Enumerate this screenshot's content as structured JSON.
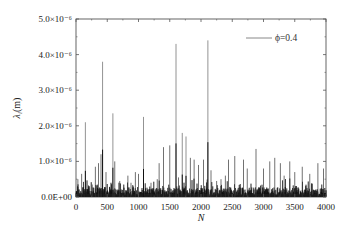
{
  "chart_data": {
    "type": "line",
    "title": "",
    "xlabel": "N",
    "ylabel": "λ_i(m)",
    "xlim": [
      0,
      4000
    ],
    "ylim": [
      0,
      5e-06
    ],
    "x_ticks": [
      0,
      500,
      1000,
      1500,
      2000,
      2500,
      3000,
      3500,
      4000
    ],
    "x_tick_labels": [
      "0",
      "500",
      "1000",
      "1500",
      "2000",
      "2500",
      "3000",
      "3500",
      "4000"
    ],
    "y_ticks": [
      0,
      1e-06,
      2e-06,
      3e-06,
      4e-06,
      5e-06
    ],
    "y_tick_labels": [
      "0.0E+00",
      "1.0×10⁻⁶",
      "2.0×10⁻⁶",
      "3.0×10⁻⁶",
      "4.0×10⁻⁶",
      "5.0×10⁻⁶"
    ],
    "grid": false,
    "legend_position": "upper right",
    "baseline_level": 1.5e-07,
    "series": [
      {
        "name": "ϕ=0.4",
        "color": "#000000",
        "description": "Noisy signal of 4000 points, dense baseline ~0–5e-7 with sparse tall spikes",
        "spikes": [
          {
            "x": 30,
            "y": 5e-07
          },
          {
            "x": 90,
            "y": 6.5e-07
          },
          {
            "x": 150,
            "y": 2.1e-06
          },
          {
            "x": 260,
            "y": 3.5e-07
          },
          {
            "x": 310,
            "y": 8.5e-07
          },
          {
            "x": 360,
            "y": 9.5e-07
          },
          {
            "x": 400,
            "y": 1.2e-06
          },
          {
            "x": 425,
            "y": 3.8e-06
          },
          {
            "x": 480,
            "y": 7e-07
          },
          {
            "x": 590,
            "y": 2.35e-06
          },
          {
            "x": 620,
            "y": 1e-06
          },
          {
            "x": 700,
            "y": 4.5e-07
          },
          {
            "x": 830,
            "y": 6e-07
          },
          {
            "x": 880,
            "y": 4e-07
          },
          {
            "x": 950,
            "y": 7e-07
          },
          {
            "x": 1000,
            "y": 6.5e-07
          },
          {
            "x": 1080,
            "y": 2.25e-06
          },
          {
            "x": 1200,
            "y": 4e-07
          },
          {
            "x": 1300,
            "y": 5e-07
          },
          {
            "x": 1330,
            "y": 9.5e-07
          },
          {
            "x": 1400,
            "y": 1.4e-06
          },
          {
            "x": 1500,
            "y": 1.45e-06
          },
          {
            "x": 1600,
            "y": 4.3e-06
          },
          {
            "x": 1640,
            "y": 5.5e-07
          },
          {
            "x": 1700,
            "y": 1.8e-06
          },
          {
            "x": 1760,
            "y": 1.7e-06
          },
          {
            "x": 1830,
            "y": 1.1e-06
          },
          {
            "x": 1890,
            "y": 1.05e-06
          },
          {
            "x": 1960,
            "y": 9e-07
          },
          {
            "x": 2040,
            "y": 1.05e-06
          },
          {
            "x": 2110,
            "y": 4.4e-06
          },
          {
            "x": 2160,
            "y": 7.5e-07
          },
          {
            "x": 2250,
            "y": 4.5e-07
          },
          {
            "x": 2320,
            "y": 5e-07
          },
          {
            "x": 2390,
            "y": 6e-07
          },
          {
            "x": 2440,
            "y": 1.05e-06
          },
          {
            "x": 2540,
            "y": 1.15e-06
          },
          {
            "x": 2680,
            "y": 1.05e-06
          },
          {
            "x": 2740,
            "y": 8e-07
          },
          {
            "x": 2880,
            "y": 1.35e-06
          },
          {
            "x": 3000,
            "y": 8e-07
          },
          {
            "x": 3100,
            "y": 1e-06
          },
          {
            "x": 3180,
            "y": 1.1e-06
          },
          {
            "x": 3270,
            "y": 9.5e-07
          },
          {
            "x": 3330,
            "y": 6e-07
          },
          {
            "x": 3420,
            "y": 1e-06
          },
          {
            "x": 3500,
            "y": 7e-07
          },
          {
            "x": 3620,
            "y": 8.5e-07
          },
          {
            "x": 3740,
            "y": 6.5e-07
          },
          {
            "x": 3870,
            "y": 9.5e-07
          },
          {
            "x": 3960,
            "y": 8e-07
          }
        ]
      }
    ],
    "legend": [
      {
        "label": "ϕ=0.4",
        "color": "#888888"
      }
    ]
  },
  "axes": {
    "ylabel_main": "λ",
    "ylabel_sub": "i",
    "ylabel_unit": "(m)",
    "xlabel": "N"
  },
  "legend": {
    "label": "ϕ=0.4"
  }
}
